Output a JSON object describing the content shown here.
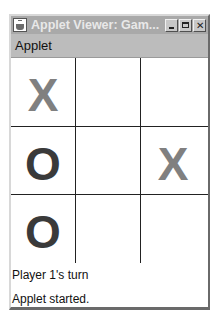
{
  "window": {
    "title": "Applet Viewer: Gam...",
    "controls": {
      "minimize": "_",
      "maximize": "□",
      "close": "✕"
    }
  },
  "menubar": {
    "items": [
      {
        "label": "Applet"
      }
    ]
  },
  "board": {
    "rows": [
      [
        "X",
        "",
        ""
      ],
      [
        "O",
        "",
        "X"
      ],
      [
        "O",
        "",
        ""
      ]
    ],
    "colors": {
      "x": "#808080",
      "o": "#3a3a3a",
      "grid": "#222222"
    }
  },
  "status": {
    "turn": "Player 1's turn",
    "applet": "Applet started."
  }
}
